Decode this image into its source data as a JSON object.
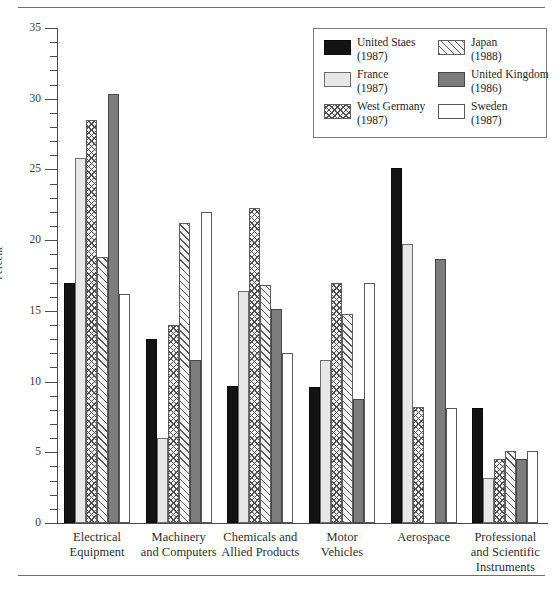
{
  "figure": {
    "ylabel": "Percent",
    "ytick_labels": [
      "0",
      "5",
      "10",
      "15",
      "20",
      "25",
      "30",
      "35"
    ]
  },
  "legend": {
    "entries": [
      {
        "name": "United Staes",
        "year": "(1987)",
        "pattern": "pat-black",
        "icon": "legend-swatch-black"
      },
      {
        "name": "Japan",
        "year": "(1988)",
        "pattern": "pat-diag",
        "icon": "legend-swatch-diagonal-hatch"
      },
      {
        "name": "France",
        "year": "(1987)",
        "pattern": "pat-lgray",
        "icon": "legend-swatch-light-gray"
      },
      {
        "name": "United Kingdom",
        "year": "(1986)",
        "pattern": "pat-dgray",
        "icon": "legend-swatch-dark-gray"
      },
      {
        "name": "West Germany",
        "year": "(1987)",
        "pattern": "pat-cross",
        "icon": "legend-swatch-crosshatch"
      },
      {
        "name": "Sweden",
        "year": "(1987)",
        "pattern": "pat-white",
        "icon": "legend-swatch-white"
      }
    ]
  },
  "chart_data": {
    "type": "bar",
    "title": "",
    "xlabel": "",
    "ylabel": "Percent",
    "ylim": [
      0,
      35
    ],
    "ytick_step": 5,
    "yminor_step": 1,
    "grid": false,
    "legend_position": "top-right",
    "categories": [
      "Electrical Equipment",
      "Machinery and Computers",
      "Chemicals and Allied Products",
      "Motor Vehicles",
      "Aerospace",
      "Professional and Scientific Instruments"
    ],
    "category_lines": [
      [
        "Electrical",
        "Equipment"
      ],
      [
        "Machinery",
        "and Computers"
      ],
      [
        "Chemicals and",
        "Allied Products"
      ],
      [
        "Motor",
        "Vehicles"
      ],
      [
        "Aerospace"
      ],
      [
        "Professional",
        "and Scientific",
        "Instruments"
      ]
    ],
    "series": [
      {
        "name": "United Staes",
        "year": "1987",
        "pattern": "pat-black",
        "values": [
          17.0,
          13.0,
          9.7,
          9.6,
          25.1,
          8.1
        ]
      },
      {
        "name": "France",
        "year": "1987",
        "pattern": "pat-lgray",
        "values": [
          25.8,
          6.0,
          16.4,
          11.5,
          19.7,
          3.2
        ]
      },
      {
        "name": "West Germany",
        "year": "1987",
        "pattern": "pat-cross",
        "values": [
          28.5,
          14.0,
          22.3,
          17.0,
          8.2,
          4.5
        ]
      },
      {
        "name": "Japan",
        "year": "1988",
        "pattern": "pat-diag",
        "values": [
          18.8,
          21.2,
          16.8,
          14.8,
          0.0,
          5.1
        ]
      },
      {
        "name": "United Kingdom",
        "year": "1986",
        "pattern": "pat-dgray",
        "values": [
          30.3,
          11.5,
          15.1,
          8.8,
          18.7,
          4.5
        ]
      },
      {
        "name": "Sweden",
        "year": "1987",
        "pattern": "pat-white",
        "values": [
          16.2,
          22.0,
          12.0,
          17.0,
          8.1,
          5.1
        ]
      }
    ]
  }
}
